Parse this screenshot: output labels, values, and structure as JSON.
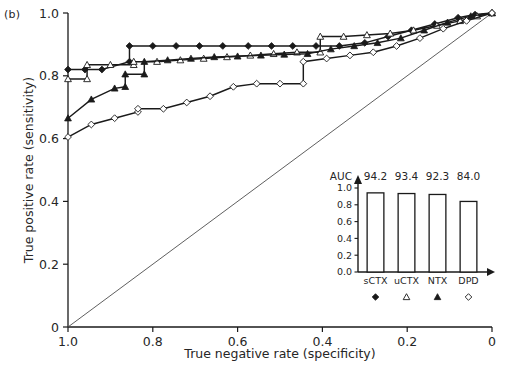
{
  "figure": {
    "panel_label": "(b)",
    "background": "#ffffff",
    "line_color": "#1a1a1a",
    "diagonal_color": "#4d4d4d"
  },
  "chart_data": {
    "type": "line",
    "title": "",
    "xlabel": "True negative rate (specificity)",
    "ylabel": "True positive rate (sensitivity)",
    "xlim": [
      1.0,
      0.0
    ],
    "ylim": [
      0.0,
      1.0
    ],
    "x_reversed": true,
    "grid": false,
    "legend_position": "inset-bottom",
    "xticks": [
      1.0,
      0.8,
      0.6,
      0.4,
      0.2,
      0
    ],
    "xtick_labels": [
      "1.0",
      "0.8",
      "0.6",
      "0.4",
      "0.2",
      "0"
    ],
    "yticks": [
      0,
      0.2,
      0.4,
      0.6,
      0.8,
      1.0
    ],
    "ytick_labels": [
      "0",
      "0.2",
      "0.4",
      "0.6",
      "0.8",
      "1.0"
    ],
    "reference_line": {
      "name": "chance-diagonal",
      "x": [
        1.0,
        0.0
      ],
      "y": [
        0.0,
        1.0
      ]
    },
    "series": [
      {
        "name": "sCTX",
        "marker": "filled-diamond",
        "auc": 94.2,
        "x": [
          1.0,
          0.96,
          0.92,
          0.855,
          0.855,
          0.8,
          0.745,
          0.69,
          0.635,
          0.575,
          0.52,
          0.47,
          0.415,
          0.36,
          0.3,
          0.245,
          0.19,
          0.135,
          0.08,
          0.04,
          0.0
        ],
        "y": [
          0.82,
          0.82,
          0.82,
          0.845,
          0.895,
          0.895,
          0.895,
          0.895,
          0.895,
          0.895,
          0.895,
          0.895,
          0.895,
          0.895,
          0.905,
          0.925,
          0.945,
          0.965,
          0.985,
          0.995,
          1.0
        ]
      },
      {
        "name": "uCTX",
        "marker": "open-triangle",
        "auc": 93.4,
        "x": [
          1.0,
          0.955,
          0.955,
          0.9,
          0.845,
          0.845,
          0.79,
          0.735,
          0.68,
          0.625,
          0.57,
          0.515,
          0.46,
          0.405,
          0.405,
          0.35,
          0.295,
          0.24,
          0.185,
          0.13,
          0.075,
          0.035,
          0.0
        ],
        "y": [
          0.79,
          0.79,
          0.835,
          0.835,
          0.835,
          0.845,
          0.845,
          0.85,
          0.855,
          0.86,
          0.865,
          0.87,
          0.875,
          0.875,
          0.925,
          0.925,
          0.93,
          0.935,
          0.945,
          0.96,
          0.975,
          0.99,
          1.0
        ]
      },
      {
        "name": "NTX",
        "marker": "filled-triangle",
        "auc": 92.3,
        "x": [
          1.0,
          0.945,
          0.89,
          0.865,
          0.865,
          0.82,
          0.82,
          0.765,
          0.71,
          0.655,
          0.6,
          0.545,
          0.49,
          0.435,
          0.38,
          0.325,
          0.27,
          0.215,
          0.16,
          0.105,
          0.05,
          0.0
        ],
        "y": [
          0.665,
          0.725,
          0.76,
          0.765,
          0.805,
          0.805,
          0.845,
          0.85,
          0.855,
          0.86,
          0.862,
          0.865,
          0.868,
          0.87,
          0.885,
          0.895,
          0.905,
          0.92,
          0.945,
          0.97,
          0.99,
          1.0
        ]
      },
      {
        "name": "DPD",
        "marker": "open-diamond",
        "auc": 84.0,
        "x": [
          1.0,
          0.945,
          0.89,
          0.835,
          0.835,
          0.775,
          0.72,
          0.665,
          0.61,
          0.555,
          0.5,
          0.445,
          0.445,
          0.39,
          0.335,
          0.28,
          0.225,
          0.17,
          0.115,
          0.06,
          0.0
        ],
        "y": [
          0.605,
          0.645,
          0.665,
          0.685,
          0.695,
          0.695,
          0.715,
          0.735,
          0.765,
          0.775,
          0.775,
          0.775,
          0.845,
          0.855,
          0.865,
          0.875,
          0.895,
          0.92,
          0.95,
          0.975,
          1.0
        ]
      }
    ]
  },
  "inset": {
    "type": "bar",
    "auc_label": "AUC",
    "categories": [
      "sCTX",
      "uCTX",
      "NTX",
      "DPD"
    ],
    "auc_values": [
      "94.2",
      "93.4",
      "92.3",
      "84.0"
    ],
    "bar_heights": [
      0.942,
      0.934,
      0.923,
      0.84
    ],
    "yticks": [
      "0.0",
      "0.2",
      "0.4",
      "0.6",
      "0.8",
      "1.0"
    ],
    "ylim": [
      0.0,
      1.0
    ],
    "markers": [
      "filled-diamond",
      "open-triangle",
      "filled-triangle",
      "open-diamond"
    ]
  }
}
